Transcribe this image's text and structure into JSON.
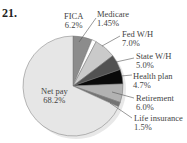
{
  "problem_number": "21.",
  "chart_data": {
    "type": "pie",
    "title": "",
    "slices": [
      {
        "label": "FICA",
        "value": 6.2,
        "display": "6.2%",
        "color": "#8c8c8c"
      },
      {
        "label": "Medicare",
        "value": 1.45,
        "display": "1.45%",
        "color": "#ffffff"
      },
      {
        "label": "Fed W/H",
        "value": 7.0,
        "display": "7.0%",
        "color": "#cacaca"
      },
      {
        "label": "State W/H",
        "value": 5.0,
        "display": "5.0%",
        "color": "#525252"
      },
      {
        "label": "Health plan",
        "value": 4.7,
        "display": "4.7%",
        "color": "#0a0a0a"
      },
      {
        "label": "Retirement",
        "value": 6.0,
        "display": "6.0%",
        "color": "#b2b2b2"
      },
      {
        "label": "Life insurance",
        "value": 1.5,
        "display": "1.5%",
        "color": "#747474"
      },
      {
        "label": "Net pay",
        "value": 68.2,
        "display": "68.2%",
        "color": "#e6e6e6"
      }
    ],
    "start_angle_deg": 0,
    "direction": "clockwise",
    "legend": "none (callout labels)"
  }
}
